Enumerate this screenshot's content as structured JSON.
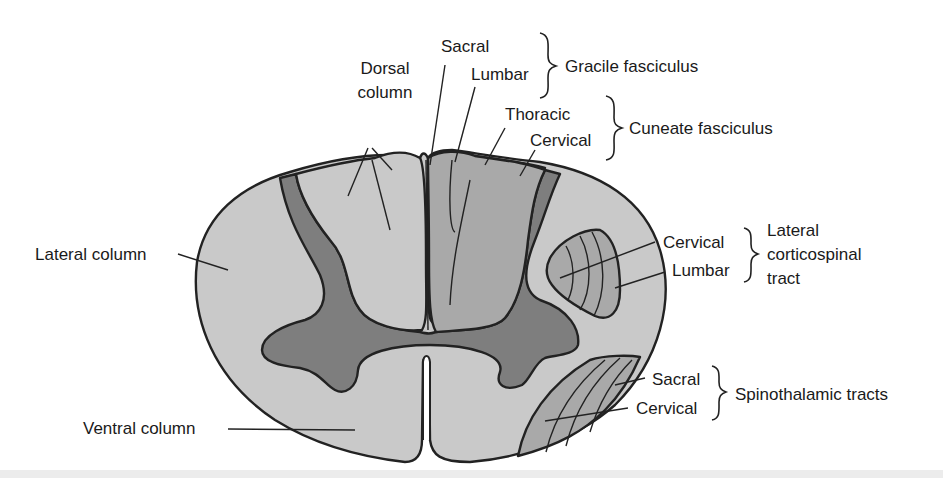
{
  "figure": {
    "colors": {
      "white_matter": "#c9c9c9",
      "gray_matter": "#7e7e7e",
      "tract_fill": "#a9a9a9",
      "outline": "#222222",
      "background": "#ffffff"
    }
  },
  "labels": {
    "dorsal_column": [
      "Dorsal",
      "column"
    ],
    "lateral_column": "Lateral column",
    "ventral_column": "Ventral column",
    "gracile": {
      "parts": [
        "Sacral",
        "Lumbar"
      ],
      "group": "Gracile fasciculus"
    },
    "cuneate": {
      "parts": [
        "Thoracic",
        "Cervical"
      ],
      "group": "Cuneate fasciculus"
    },
    "corticospinal": {
      "parts": [
        "Cervical",
        "Lumbar"
      ],
      "group": [
        "Lateral",
        "corticospinal",
        "tract"
      ]
    },
    "spinothalamic": {
      "parts": [
        "Sacral",
        "Cervical"
      ],
      "group": "Spinothalamic tracts"
    }
  }
}
